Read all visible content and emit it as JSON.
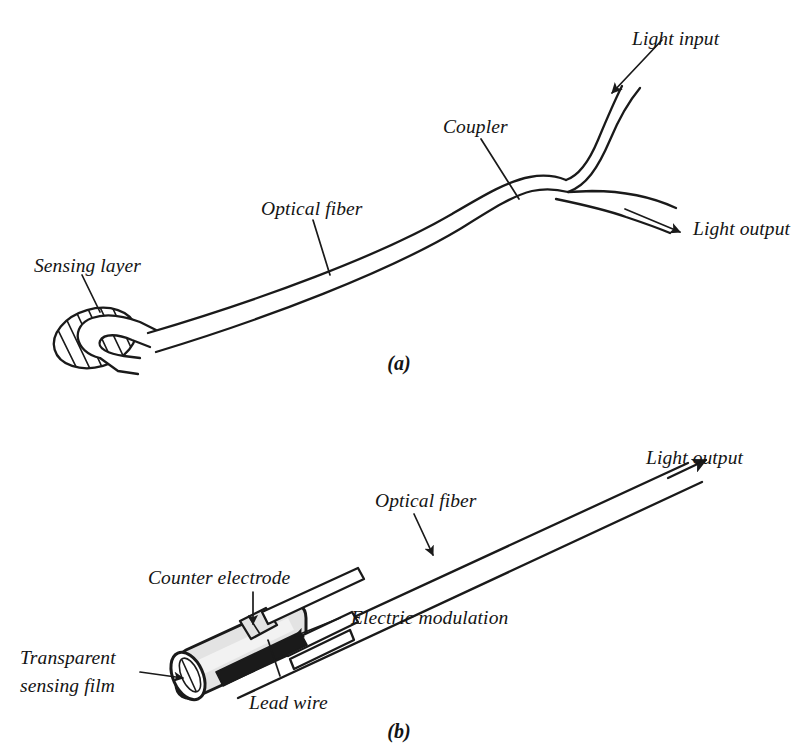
{
  "figure": {
    "background_color": "#ffffff",
    "ink_color": "#1a1a1a",
    "width": 812,
    "height": 753
  },
  "panel_a": {
    "caption": "(a)",
    "labels": {
      "light_input": "Light input",
      "light_output": "Light output",
      "coupler": "Coupler",
      "optical_fiber": "Optical fiber",
      "sensing_layer": "Sensing layer"
    }
  },
  "panel_b": {
    "caption": "(b)",
    "labels": {
      "light_output": "Light output",
      "optical_fiber": "Optical fiber",
      "counter_electrode": "Counter electrode",
      "electric_modulation": "Electric modulation",
      "transparent_sensing_film_line1": "Transparent",
      "transparent_sensing_film_line2": "sensing film",
      "lead_wire": "Lead wire"
    }
  }
}
